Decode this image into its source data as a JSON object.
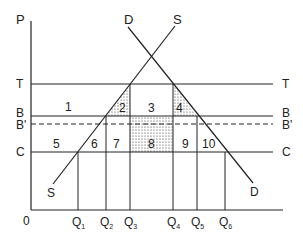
{
  "diagram": {
    "axes": {
      "y_label": "P",
      "origin_label": "0"
    },
    "price_lines": [
      {
        "id": "T",
        "label_left": "T",
        "label_right": "T",
        "y": 84,
        "style": "solid"
      },
      {
        "id": "B",
        "label_left": "B",
        "label_right": "B",
        "y": 116,
        "style": "solid"
      },
      {
        "id": "B_prime",
        "label_left": "B'",
        "label_right": "B'",
        "y": 124,
        "style": "dashed"
      },
      {
        "id": "C",
        "label_left": "C",
        "label_right": "C",
        "y": 152,
        "style": "solid"
      }
    ],
    "curves": {
      "demand": {
        "top_label": "D",
        "bottom_label": "D"
      },
      "supply": {
        "top_label": "S",
        "bottom_label": "S"
      }
    },
    "quantities": [
      {
        "label": "Q",
        "sub": "1",
        "x": 78
      },
      {
        "label": "Q",
        "sub": "2",
        "x": 106
      },
      {
        "label": "Q",
        "sub": "3",
        "x": 130
      },
      {
        "label": "Q",
        "sub": "4",
        "x": 173
      },
      {
        "label": "Q",
        "sub": "5",
        "x": 197
      },
      {
        "label": "Q",
        "sub": "6",
        "x": 225
      }
    ],
    "regions": [
      "1",
      "2",
      "3",
      "4",
      "5",
      "6",
      "7",
      "8",
      "9",
      "10"
    ]
  }
}
